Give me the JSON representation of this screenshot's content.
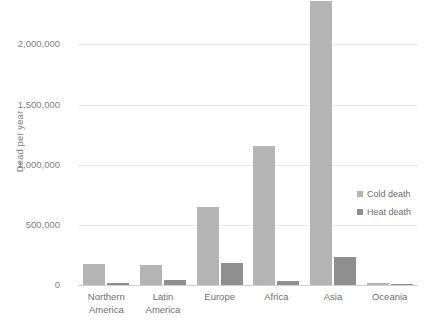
{
  "chart_data": {
    "type": "bar",
    "title": "",
    "xlabel": "",
    "ylabel": "Dead per year",
    "categories": [
      "Northern America",
      "Latin America",
      "Europe",
      "Africa",
      "Asia",
      "Oceania"
    ],
    "category_lines": [
      [
        "Northern",
        "America"
      ],
      [
        "Latin",
        "America"
      ],
      [
        "Europe",
        ""
      ],
      [
        "Africa",
        ""
      ],
      [
        "Asia",
        ""
      ],
      [
        "Oceania",
        ""
      ]
    ],
    "series": [
      {
        "name": "Cold death",
        "color": "#b4b4b4",
        "values": [
          175000,
          170000,
          650000,
          1160000,
          2360000,
          20000
        ]
      },
      {
        "name": "Heat death",
        "color": "#8f8f8f",
        "values": [
          15000,
          45000,
          180000,
          30000,
          230000,
          3000
        ]
      }
    ],
    "ylim": [
      0,
      2370000
    ],
    "yticks": [
      0,
      500000,
      1000000,
      1500000,
      2000000
    ],
    "ytick_labels": [
      "0",
      "500,000",
      "1,000,000",
      "1,500,000",
      "2,000,000"
    ],
    "grid": true,
    "legend_position": "right-middle",
    "note": "Asia cold-death bar is clipped by the top edge of the plot"
  },
  "legend": {
    "items": [
      {
        "label": "Cold death"
      },
      {
        "label": "Heat death"
      }
    ]
  }
}
